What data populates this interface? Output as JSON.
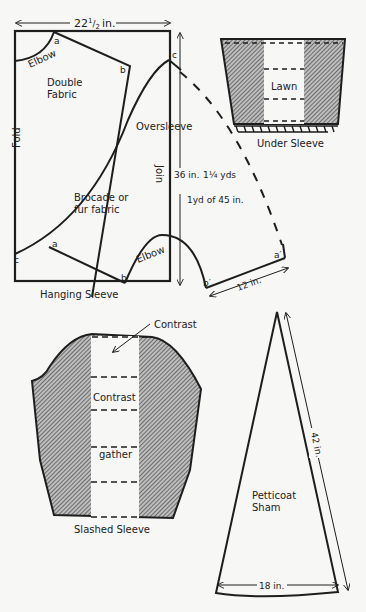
{
  "colors": {
    "ink": "#1e1e1e",
    "paper": "#f7f7f5",
    "hatch": "#555555"
  },
  "hanging_sleeve": {
    "caption": "Hanging Sleeve",
    "width_label": "22",
    "width_frac_num": "1",
    "width_frac_den": "2",
    "width_unit": "in.",
    "fold_label": "Fold",
    "join_label": "Join",
    "elbow_top_label": "Elbow",
    "elbow_bottom_label": "Elbow",
    "double_fabric_line1": "Double",
    "double_fabric_line2": "Fabric",
    "brocade_line1": "Brocade or",
    "brocade_line2": "fur fabric",
    "oversleeve_label": "Oversleeve",
    "length_label": "36 in.",
    "yardage_1": "1¼ yds",
    "yardage_2": "1yd of 45 in.",
    "side_length_label": "12 in.",
    "points": {
      "a_top": "a",
      "b_top": "b",
      "c_top": "c",
      "a_bottom": "a",
      "b_bottom": "b",
      "c_bottom": "c",
      "a_prime": "a′",
      "b_prime": "b′"
    }
  },
  "under_sleeve": {
    "caption": "Under Sleeve",
    "center_label": "Lawn"
  },
  "slashed_sleeve": {
    "caption": "Slashed Sleeve",
    "top_pointer_label": "Contrast",
    "center_label": "Contrast",
    "gather_label": "gather"
  },
  "petticoat_sham": {
    "label_line1": "Petticoat",
    "label_line2": "Sham",
    "length_label": "42 in.",
    "base_label": "18 in."
  }
}
